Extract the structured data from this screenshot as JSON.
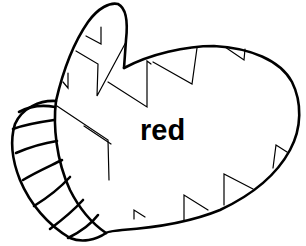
{
  "illustration": {
    "subject": "mitten",
    "label": "red",
    "colors": {
      "line": "#000000",
      "background": "#ffffff"
    }
  }
}
